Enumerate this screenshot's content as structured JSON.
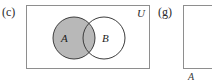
{
  "figure": {
    "type": "venn-diagram-set",
    "panels": [
      {
        "key": "c",
        "label": "(c)",
        "universe_label": "U",
        "sets": [
          {
            "name": "A",
            "label": "A",
            "fill": "#b8b8b8",
            "shaded": true
          },
          {
            "name": "B",
            "label": "B",
            "fill": "#ffffff",
            "shaded": false
          }
        ],
        "shaded_region_description": "A"
      },
      {
        "key": "g",
        "label": "(g)",
        "caption": "A",
        "clipped": true
      }
    ]
  },
  "colors": {
    "shade_gray": "#b8b8b8",
    "outline_gray": "#8e8e8e",
    "circle_stroke": "#3c3c3c",
    "text": "#2a2a2a",
    "background": "#ffffff"
  }
}
